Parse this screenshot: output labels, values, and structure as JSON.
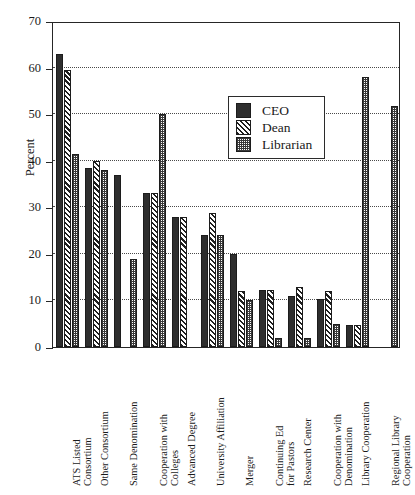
{
  "chart_data": {
    "type": "bar",
    "title": "",
    "xlabel": "",
    "ylabel": "Percent",
    "ylim": [
      0,
      70
    ],
    "ytick_values": [
      0,
      10,
      20,
      30,
      40,
      50,
      60,
      70
    ],
    "ytick_labels": [
      "0",
      "10",
      "20",
      "30",
      "40",
      "50",
      "60",
      "70"
    ],
    "grid": true,
    "legend_position": "upper center",
    "categories": [
      "ATS Listed\nConsortium",
      "Other Consortium",
      "Same Denomination",
      "Cooperation with\nColleges",
      "Advanced Degree",
      "University Affiliation",
      "Merger",
      "Continuing Ed\nfor Pastors",
      "Research Center",
      "Cooperation with\nDenomination",
      "Library Cooperation",
      "Regional Library\nCooperation"
    ],
    "series": [
      {
        "name": "CEO",
        "fill": "solid-dark",
        "color": "#2e2e2e",
        "values": [
          63,
          38.5,
          37,
          33,
          28,
          24,
          20,
          12.3,
          11,
          10.3,
          4.7,
          0
        ]
      },
      {
        "name": "Dean",
        "fill": "diagonal-hatch",
        "color": "#1f1f1f",
        "values": [
          59.5,
          40,
          0,
          33,
          28,
          28.7,
          12,
          12.3,
          12.8,
          12,
          4.7,
          0
        ]
      },
      {
        "name": "Librarian",
        "fill": "dotted-stipple",
        "color": "#3a3a3a",
        "values": [
          41.5,
          38,
          19,
          50,
          0,
          24,
          10,
          2,
          2,
          5,
          58,
          51.8
        ]
      }
    ]
  },
  "legend": {
    "items": [
      {
        "label": "CEO",
        "swatch": "solid-dark-swatch"
      },
      {
        "label": "Dean",
        "swatch": "diagonal-hatch-swatch"
      },
      {
        "label": "Librarian",
        "swatch": "dotted-stipple-swatch"
      }
    ]
  },
  "colors": {
    "axis": "#262626",
    "grid": "#4a4a4a",
    "background": "#ffffff",
    "ceo": "#2e2e2e",
    "dean": "#1f1f1f",
    "librarian": "#3a3a3a"
  }
}
